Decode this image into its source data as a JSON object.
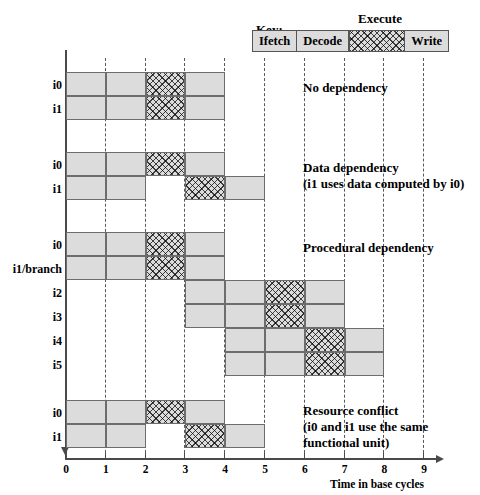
{
  "figure": {
    "key_label": "Key:",
    "execute_label": "Execute",
    "axis_caption": "Time in base cycles",
    "colors": {
      "stage_fill": "#dcdcdc",
      "stage_border": "#6d6d6d",
      "gridline": "#55585e",
      "axis": "#4a4a4a",
      "text": "#000000"
    }
  },
  "legend": {
    "stages": [
      {
        "name": "ifetch",
        "label": "Ifetch",
        "pattern": "solid"
      },
      {
        "name": "decode",
        "label": "Decode",
        "pattern": "solid"
      },
      {
        "name": "execute",
        "label": "Execute",
        "pattern": "crosshatch"
      },
      {
        "name": "write",
        "label": "Write",
        "pattern": "solid"
      }
    ]
  },
  "axis": {
    "ticks": [
      "0",
      "1",
      "2",
      "3",
      "4",
      "5",
      "6",
      "7",
      "8",
      "9"
    ],
    "min": 0,
    "max": 9,
    "caption": "Time in base cycles"
  },
  "chart_data": {
    "type": "bar",
    "xlabel": "Time in base cycles",
    "ylabel": "",
    "xlim": [
      0,
      9
    ],
    "grid": true,
    "legend_position": "top",
    "groups": [
      {
        "name": "no-dependency",
        "annotation": [
          "No dependency"
        ],
        "rows": [
          {
            "label": "i0",
            "segments": [
              {
                "stage": "Ifetch",
                "start": 0,
                "end": 1,
                "pattern": "solid"
              },
              {
                "stage": "Decode",
                "start": 1,
                "end": 2,
                "pattern": "solid"
              },
              {
                "stage": "Execute",
                "start": 2,
                "end": 3,
                "pattern": "crosshatch"
              },
              {
                "stage": "Write",
                "start": 3,
                "end": 4,
                "pattern": "solid"
              }
            ]
          },
          {
            "label": "i1",
            "segments": [
              {
                "stage": "Ifetch",
                "start": 0,
                "end": 1,
                "pattern": "solid"
              },
              {
                "stage": "Decode",
                "start": 1,
                "end": 2,
                "pattern": "solid"
              },
              {
                "stage": "Execute",
                "start": 2,
                "end": 3,
                "pattern": "crosshatch"
              },
              {
                "stage": "Write",
                "start": 3,
                "end": 4,
                "pattern": "solid"
              }
            ]
          }
        ]
      },
      {
        "name": "data-dependency",
        "annotation": [
          "Data dependency",
          "(i1 uses data computed by i0)"
        ],
        "rows": [
          {
            "label": "i0",
            "segments": [
              {
                "stage": "Ifetch",
                "start": 0,
                "end": 1,
                "pattern": "solid"
              },
              {
                "stage": "Decode",
                "start": 1,
                "end": 2,
                "pattern": "solid"
              },
              {
                "stage": "Execute",
                "start": 2,
                "end": 3,
                "pattern": "crosshatch"
              },
              {
                "stage": "Write",
                "start": 3,
                "end": 4,
                "pattern": "solid"
              }
            ]
          },
          {
            "label": "i1",
            "segments": [
              {
                "stage": "Ifetch",
                "start": 0,
                "end": 1,
                "pattern": "solid"
              },
              {
                "stage": "Decode",
                "start": 1,
                "end": 2,
                "pattern": "solid"
              },
              {
                "stage": "Execute",
                "start": 3,
                "end": 4,
                "pattern": "crosshatch"
              },
              {
                "stage": "Write",
                "start": 4,
                "end": 5,
                "pattern": "solid"
              }
            ]
          }
        ]
      },
      {
        "name": "procedural-dependency",
        "annotation": [
          "Procedural dependency"
        ],
        "rows": [
          {
            "label": "i0",
            "segments": [
              {
                "stage": "Ifetch",
                "start": 0,
                "end": 1,
                "pattern": "solid"
              },
              {
                "stage": "Decode",
                "start": 1,
                "end": 2,
                "pattern": "solid"
              },
              {
                "stage": "Execute",
                "start": 2,
                "end": 3,
                "pattern": "crosshatch"
              },
              {
                "stage": "Write",
                "start": 3,
                "end": 4,
                "pattern": "solid"
              }
            ]
          },
          {
            "label": "i1/branch",
            "segments": [
              {
                "stage": "Ifetch",
                "start": 0,
                "end": 1,
                "pattern": "solid"
              },
              {
                "stage": "Decode",
                "start": 1,
                "end": 2,
                "pattern": "solid"
              },
              {
                "stage": "Execute",
                "start": 2,
                "end": 3,
                "pattern": "crosshatch"
              },
              {
                "stage": "Write",
                "start": 3,
                "end": 4,
                "pattern": "solid"
              }
            ]
          },
          {
            "label": "i2",
            "segments": [
              {
                "stage": "Ifetch",
                "start": 3,
                "end": 4,
                "pattern": "solid"
              },
              {
                "stage": "Decode",
                "start": 4,
                "end": 5,
                "pattern": "solid"
              },
              {
                "stage": "Execute",
                "start": 5,
                "end": 6,
                "pattern": "crosshatch"
              },
              {
                "stage": "Write",
                "start": 6,
                "end": 7,
                "pattern": "solid"
              }
            ]
          },
          {
            "label": "i3",
            "segments": [
              {
                "stage": "Ifetch",
                "start": 3,
                "end": 4,
                "pattern": "solid"
              },
              {
                "stage": "Decode",
                "start": 4,
                "end": 5,
                "pattern": "solid"
              },
              {
                "stage": "Execute",
                "start": 5,
                "end": 6,
                "pattern": "crosshatch"
              },
              {
                "stage": "Write",
                "start": 6,
                "end": 7,
                "pattern": "solid"
              }
            ]
          },
          {
            "label": "i4",
            "segments": [
              {
                "stage": "Ifetch",
                "start": 4,
                "end": 5,
                "pattern": "solid"
              },
              {
                "stage": "Decode",
                "start": 5,
                "end": 6,
                "pattern": "solid"
              },
              {
                "stage": "Execute",
                "start": 6,
                "end": 7,
                "pattern": "crosshatch"
              },
              {
                "stage": "Write",
                "start": 7,
                "end": 8,
                "pattern": "solid"
              }
            ]
          },
          {
            "label": "i5",
            "segments": [
              {
                "stage": "Ifetch",
                "start": 4,
                "end": 5,
                "pattern": "solid"
              },
              {
                "stage": "Decode",
                "start": 5,
                "end": 6,
                "pattern": "solid"
              },
              {
                "stage": "Execute",
                "start": 6,
                "end": 7,
                "pattern": "crosshatch"
              },
              {
                "stage": "Write",
                "start": 7,
                "end": 8,
                "pattern": "solid"
              }
            ]
          }
        ]
      },
      {
        "name": "resource-conflict",
        "annotation": [
          "Resource conflict",
          "(i0 and i1 use the same",
          "functional unit)"
        ],
        "rows": [
          {
            "label": "i0",
            "segments": [
              {
                "stage": "Ifetch",
                "start": 0,
                "end": 1,
                "pattern": "solid"
              },
              {
                "stage": "Decode",
                "start": 1,
                "end": 2,
                "pattern": "solid"
              },
              {
                "stage": "Execute",
                "start": 2,
                "end": 3,
                "pattern": "crosshatch"
              },
              {
                "stage": "Write",
                "start": 3,
                "end": 4,
                "pattern": "solid"
              }
            ]
          },
          {
            "label": "i1",
            "segments": [
              {
                "stage": "Ifetch",
                "start": 0,
                "end": 1,
                "pattern": "solid"
              },
              {
                "stage": "Decode",
                "start": 1,
                "end": 2,
                "pattern": "solid"
              },
              {
                "stage": "Execute",
                "start": 3,
                "end": 4,
                "pattern": "crosshatch"
              },
              {
                "stage": "Write",
                "start": 4,
                "end": 5,
                "pattern": "solid"
              }
            ]
          }
        ]
      }
    ]
  }
}
